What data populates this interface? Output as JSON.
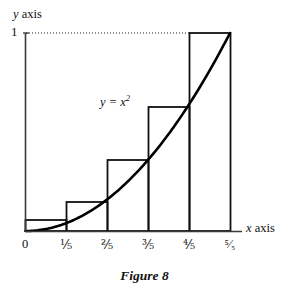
{
  "figure": {
    "caption": "Figure 8",
    "curve_equation_base": "y = x",
    "curve_equation_exponent": "2",
    "curve_equation_full": "y = x²",
    "background_color": "#ffffff",
    "ink_color": "#111111"
  },
  "axes": {
    "y_label_italic": "y",
    "y_label_rest": " axis",
    "x_label_italic": "x",
    "x_label_rest": " axis",
    "y_tick_label": "1",
    "x_tick_labels": [
      "0",
      "⅕",
      "⅖",
      "⅗",
      "⅘",
      "⁵⁄₅"
    ]
  },
  "chart_data": {
    "type": "area",
    "title": "Figure 8",
    "subtitle": "",
    "xlabel": "x axis",
    "ylabel": "y axis",
    "annotations": [
      "y = x²"
    ],
    "grid": false,
    "legend": "none",
    "xlim": [
      0,
      1
    ],
    "ylim": [
      0,
      1
    ],
    "x_tick_values": [
      0,
      0.2,
      0.4,
      0.6,
      0.8,
      1.0
    ],
    "x_tick_labels": [
      "0",
      "1/5",
      "2/5",
      "3/5",
      "4/5",
      "5/5"
    ],
    "y_tick_values": [
      1
    ],
    "y_tick_labels": [
      "1"
    ],
    "series": [
      {
        "name": "y = x^2",
        "type": "line",
        "x": [
          0,
          0.1,
          0.2,
          0.3,
          0.4,
          0.5,
          0.6,
          0.7,
          0.8,
          0.9,
          1.0
        ],
        "values": [
          0,
          0.01,
          0.04,
          0.09,
          0.16,
          0.25,
          0.36,
          0.49,
          0.64,
          0.81,
          1.0
        ]
      },
      {
        "name": "right-endpoint rectangles",
        "type": "bar",
        "categories": [
          "0–1/5",
          "1/5–2/5",
          "2/5–3/5",
          "3/5–4/5",
          "4/5–5/5"
        ],
        "bar_left_edges": [
          0,
          0.2,
          0.4,
          0.6,
          0.8
        ],
        "bar_right_edges": [
          0.2,
          0.4,
          0.6,
          0.8,
          1.0
        ],
        "values": [
          0.04,
          0.16,
          0.36,
          0.64,
          1.0
        ]
      }
    ]
  }
}
